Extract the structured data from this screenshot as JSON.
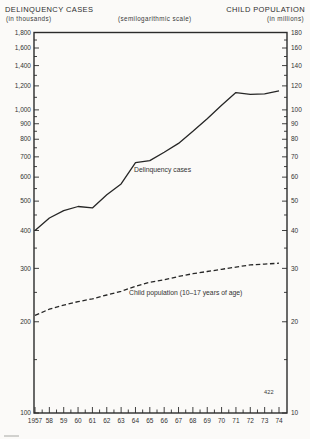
{
  "header": {
    "left_title": "DELINQUENCY CASES",
    "left_subtitle": "(in thousands)",
    "center_note": "(semilogarithmic scale)",
    "right_title": "CHILD POPULATION",
    "right_subtitle": "(in millions)"
  },
  "page_number": "422",
  "colors": {
    "paper": "#fbfaf8",
    "line": "#262626",
    "axis": "#2b2b2b",
    "text": "#333333"
  },
  "chart_data": {
    "type": "line",
    "scale": "semilogarithmic-y",
    "title": "",
    "x_tick_labels": [
      "1957",
      "58",
      "59",
      "60",
      "61",
      "62",
      "63",
      "64",
      "65",
      "66",
      "67",
      "68",
      "69",
      "70",
      "71",
      "72",
      "73",
      "74"
    ],
    "x_years": [
      1957,
      1958,
      1959,
      1960,
      1961,
      1962,
      1963,
      1964,
      1965,
      1966,
      1967,
      1968,
      1969,
      1970,
      1971,
      1972,
      1973,
      1974
    ],
    "left_axis": {
      "label": "DELINQUENCY CASES (in thousands)",
      "range": [
        100,
        1800
      ],
      "major_tick_values": [
        1800,
        1600,
        1400,
        1200,
        1000,
        900,
        800,
        700,
        600,
        500,
        400,
        300,
        200,
        100
      ],
      "major_tick_labels": [
        "1,800",
        "1,600",
        "1,400",
        "1,200",
        "1,000",
        "900",
        "800",
        "700",
        "600",
        "500",
        "400",
        "300",
        "200",
        "100"
      ],
      "minor_tick_values": [
        1700,
        1500,
        1300,
        1100,
        950,
        850,
        750,
        650,
        550,
        450,
        350,
        250,
        150
      ]
    },
    "right_axis": {
      "label": "CHILD POPULATION (in millions)",
      "range": [
        10,
        180
      ],
      "major_tick_values": [
        180,
        160,
        140,
        120,
        100,
        90,
        80,
        70,
        60,
        50,
        40,
        30,
        20,
        10
      ],
      "major_tick_labels": [
        "180",
        "160",
        "140",
        "120",
        "100",
        "90",
        "80",
        "70",
        "60",
        "50",
        "40",
        "30",
        "20",
        "10"
      ],
      "minor_tick_values": [
        170,
        150,
        130,
        110,
        95,
        85,
        75,
        65,
        55,
        45,
        35,
        25,
        15
      ]
    },
    "series": [
      {
        "name": "Delinquency cases",
        "axis": "left",
        "style": "solid",
        "values": [
          400,
          440,
          465,
          480,
          475,
          525,
          570,
          670,
          680,
          725,
          775,
          850,
          935,
          1035,
          1140,
          1125,
          1130,
          1155
        ]
      },
      {
        "name": "Child population (10–17 years of age)",
        "axis": "right",
        "style": "dashed",
        "values": [
          21,
          22,
          22.7,
          23.3,
          23.8,
          24.5,
          25.2,
          26.2,
          27,
          27.5,
          28.2,
          28.8,
          29.3,
          29.8,
          30.3,
          30.8,
          31,
          31.2
        ]
      }
    ],
    "legend_position": "inline-annotations",
    "grid": false
  }
}
